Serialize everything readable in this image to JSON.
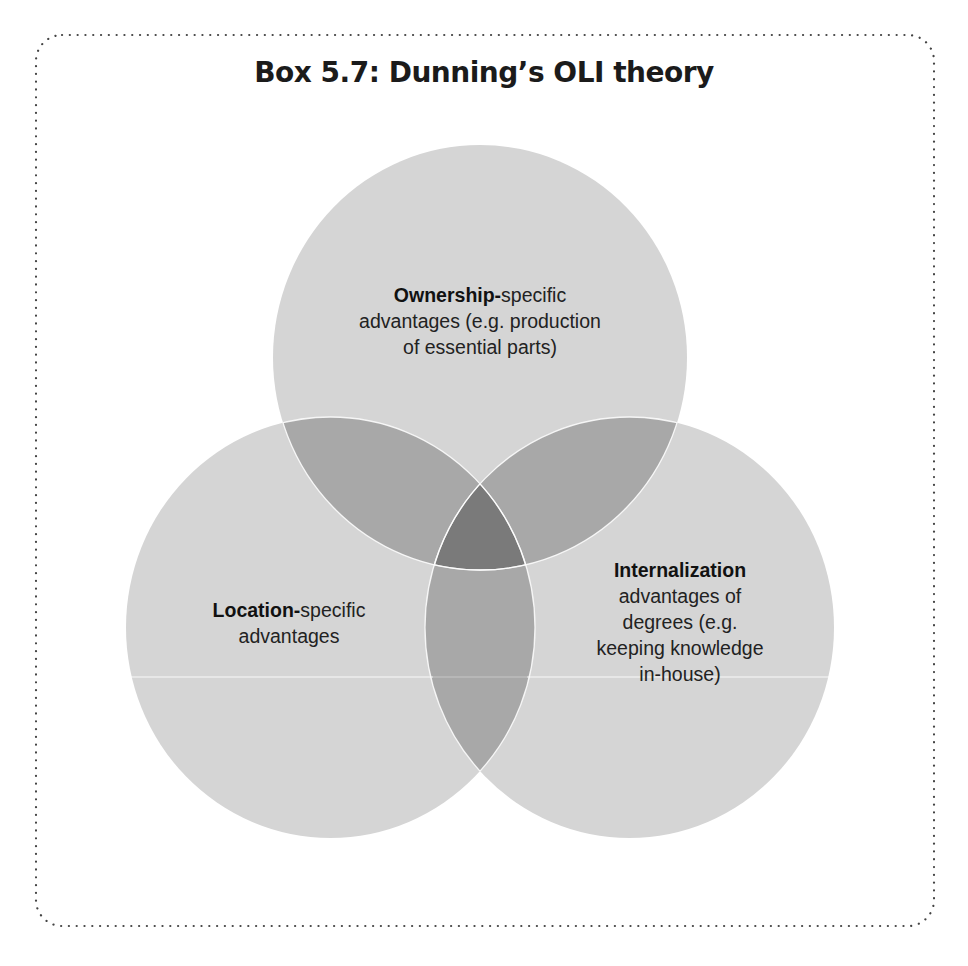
{
  "title": "Box 5.7: Dunning’s OLI theory",
  "colors": {
    "circle_fill": "#d5d5d5",
    "pair_overlap": "#a8a8a8",
    "triple_overlap": "#7a7a7a",
    "separator": "#ffffff",
    "border_dots": "#444444"
  },
  "circles": {
    "ownership": {
      "bold": "Ownership-",
      "lines": [
        "specific",
        "advantages (e.g. production",
        "of essential parts)"
      ]
    },
    "location": {
      "bold": "Location-",
      "lines": [
        "specific",
        "advantages"
      ]
    },
    "internalization": {
      "bold": "Internalization",
      "lines": [
        "advantages of",
        "degrees (e.g.",
        "keeping knowledge",
        "in-house)"
      ]
    }
  }
}
